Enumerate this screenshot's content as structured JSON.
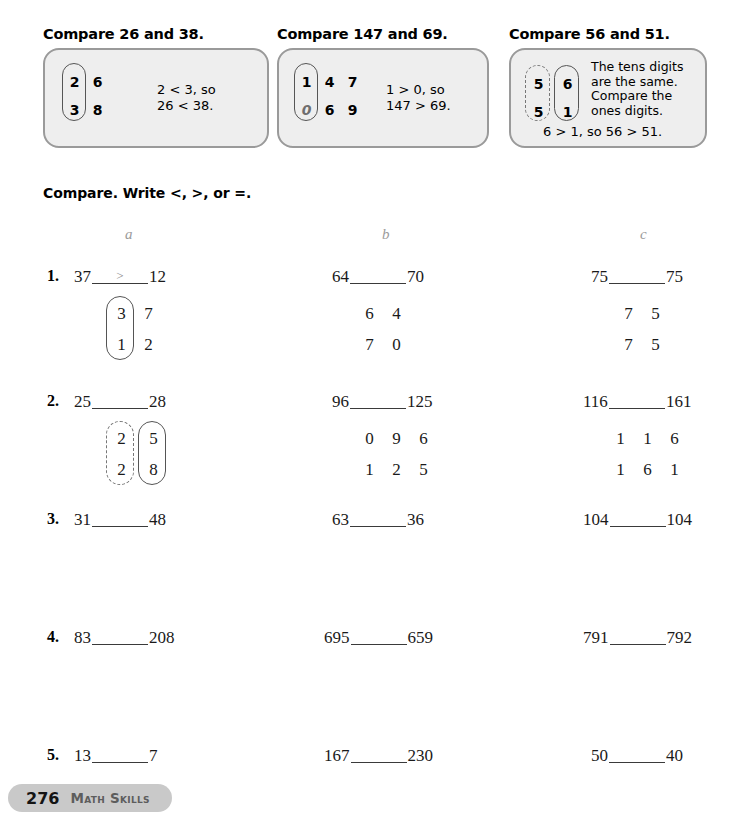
{
  "examples": [
    {
      "title": "Compare 26 and 38.",
      "top_digits": [
        "2",
        "6"
      ],
      "bottom_digits": [
        "3",
        "8"
      ],
      "explanation": "2 < 3, so\n26 < 38.",
      "oval_column": "tens",
      "oval_style": "solid"
    },
    {
      "title": "Compare 147 and 69.",
      "top_digits": [
        "1",
        "4",
        "7"
      ],
      "bottom_digits": [
        "0",
        "6",
        "9"
      ],
      "bottom_first_implied": true,
      "explanation": "1 > 0, so\n147 > 69.",
      "oval_column": "hundreds",
      "oval_style": "solid"
    },
    {
      "title": "Compare 56 and 51.",
      "top_digits": [
        "5",
        "6"
      ],
      "bottom_digits": [
        "5",
        "1"
      ],
      "explanation": "The tens digits\nare the same.\nCompare the\nones digits.",
      "conclusion": "6 > 1, so 56 > 51.",
      "oval_column": "both",
      "oval_style": "dashed-tens-solid-ones"
    }
  ],
  "directions": "Compare. Write <, >, or =.",
  "column_headers": [
    "a",
    "b",
    "c"
  ],
  "problems": [
    {
      "number": "1.",
      "a": {
        "left": "37",
        "right": "12",
        "answer": ">",
        "work": [
          [
            "3",
            "7"
          ],
          [
            "1",
            "2"
          ]
        ],
        "oval": "solid-tens"
      },
      "b": {
        "left": "64",
        "right": "70",
        "answer": "",
        "work": [
          [
            "6",
            "4"
          ],
          [
            "7",
            "0"
          ]
        ],
        "oval": "none"
      },
      "c": {
        "left": "75",
        "right": "75",
        "answer": "",
        "work": [
          [
            "7",
            "5"
          ],
          [
            "7",
            "5"
          ]
        ],
        "oval": "none"
      }
    },
    {
      "number": "2.",
      "a": {
        "left": "25",
        "right": "28",
        "answer": "",
        "work": [
          [
            "2",
            "5"
          ],
          [
            "2",
            "8"
          ]
        ],
        "oval": "dashed-tens-solid-ones"
      },
      "b": {
        "left": "96",
        "right": "125",
        "answer": "",
        "work": [
          [
            "0",
            "9",
            "6"
          ],
          [
            "1",
            "2",
            "5"
          ]
        ],
        "oval": "none"
      },
      "c": {
        "left": "116",
        "right": "161",
        "answer": "",
        "work": [
          [
            "1",
            "1",
            "6"
          ],
          [
            "1",
            "6",
            "1"
          ]
        ],
        "oval": "none"
      }
    },
    {
      "number": "3.",
      "a": {
        "left": "31",
        "right": "48",
        "answer": "",
        "work": [],
        "oval": "none"
      },
      "b": {
        "left": "63",
        "right": "36",
        "answer": "",
        "work": [],
        "oval": "none"
      },
      "c": {
        "left": "104",
        "right": "104",
        "answer": "",
        "work": [],
        "oval": "none"
      }
    },
    {
      "number": "4.",
      "a": {
        "left": "83",
        "right": "208",
        "answer": "",
        "work": [],
        "oval": "none"
      },
      "b": {
        "left": "695",
        "right": "659",
        "answer": "",
        "work": [],
        "oval": "none"
      },
      "c": {
        "left": "791",
        "right": "792",
        "answer": "",
        "work": [],
        "oval": "none"
      }
    },
    {
      "number": "5.",
      "a": {
        "left": "13",
        "right": "7",
        "answer": "",
        "work": [],
        "oval": "none"
      },
      "b": {
        "left": "167",
        "right": "230",
        "answer": "",
        "work": [],
        "oval": "none"
      },
      "c": {
        "left": "50",
        "right": "40",
        "answer": "",
        "work": [],
        "oval": "none"
      }
    }
  ],
  "footer": {
    "page_number": "276",
    "label": "Math Skills"
  },
  "colors": {
    "example_box_fill": "#eeeeee",
    "example_box_border": "#9a9a9a",
    "footer_pill": "#c9c9c9",
    "column_header_text": "#9b9b9b",
    "sample_answer_text": "#8d8d8d"
  }
}
